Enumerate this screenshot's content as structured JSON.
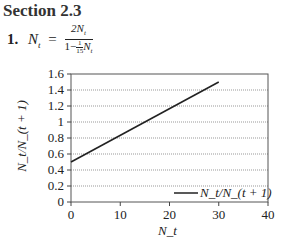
{
  "section": {
    "title": "Section 2.3"
  },
  "equation": {
    "number": "1.",
    "lhs": "N",
    "lhs_sub": "t",
    "equals": "=",
    "numerator": "2N",
    "numerator_sub": "t",
    "denominator_prefix": "1−",
    "denominator_frac_top": "1",
    "denominator_frac_bottom": "15",
    "denominator_var": "N",
    "denominator_var_sub": "t"
  },
  "chart_data": {
    "type": "line",
    "title": "",
    "xlabel": "N_t",
    "ylabel": "N_t/N_(t + 1)",
    "xlim": [
      0,
      40
    ],
    "ylim": [
      0,
      1.6
    ],
    "x_ticks": [
      "0",
      "10",
      "20",
      "30",
      "40"
    ],
    "y_ticks": [
      "0",
      "0.2",
      "0.4",
      "0.6",
      "0.8",
      "1",
      "1.2",
      "1.4",
      "1.6"
    ],
    "grid": {
      "horizontal": true,
      "style": "dotted",
      "vertical": false
    },
    "legend": {
      "position": "lower right",
      "entries": [
        "N_t/N_(t + 1)"
      ]
    },
    "series": [
      {
        "name": "N_t/N_(t + 1)",
        "color": "#222222",
        "x": [
          0,
          30
        ],
        "y": [
          0.5,
          1.5
        ]
      }
    ]
  }
}
